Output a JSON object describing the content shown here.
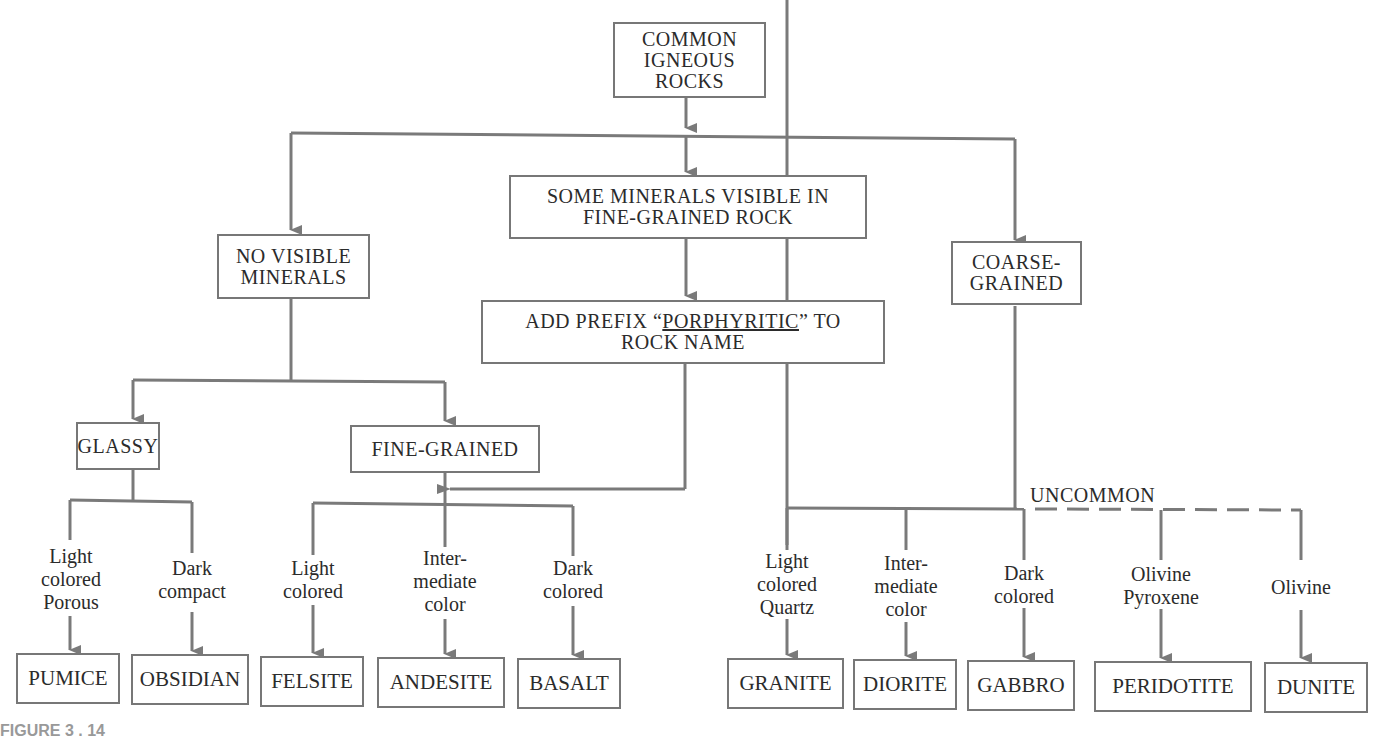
{
  "diagram": {
    "root": {
      "lines": [
        "COMMON",
        "IGNEOUS",
        "ROCKS"
      ]
    },
    "branches": {
      "no_visible": {
        "lines": [
          "NO VISIBLE",
          "MINERALS"
        ]
      },
      "some_visible": {
        "lines": [
          "SOME MINERALS VISIBLE IN",
          "FINE-GRAINED ROCK"
        ]
      },
      "porphyritic": {
        "line1_pre": "ADD PREFIX “",
        "line1_u": "PORPHYRITIC",
        "line1_post": "” TO",
        "line2": "ROCK NAME"
      },
      "coarse": {
        "lines": [
          "COARSE-",
          "GRAINED"
        ]
      }
    },
    "textures": {
      "glassy": "GLASSY",
      "fine_grained": "FINE-GRAINED"
    },
    "uncommon_label": "UNCOMMON",
    "criteria": [
      {
        "id": "pumice",
        "lines": [
          "Light",
          "colored",
          "Porous"
        ]
      },
      {
        "id": "obsidian",
        "lines": [
          "Dark",
          "compact"
        ]
      },
      {
        "id": "felsite",
        "lines": [
          "Light",
          "colored"
        ]
      },
      {
        "id": "andesite",
        "lines": [
          "Inter-",
          "mediate",
          "color"
        ]
      },
      {
        "id": "basalt",
        "lines": [
          "Dark",
          "colored"
        ]
      },
      {
        "id": "granite",
        "lines": [
          "Light",
          "colored",
          "Quartz"
        ]
      },
      {
        "id": "diorite",
        "lines": [
          "Inter-",
          "mediate",
          "color"
        ]
      },
      {
        "id": "gabbro",
        "lines": [
          "Dark",
          "colored"
        ]
      },
      {
        "id": "peridotite",
        "lines": [
          "Olivine",
          "Pyroxene"
        ]
      },
      {
        "id": "dunite",
        "lines": [
          "Olivine"
        ]
      }
    ],
    "rocks": [
      "PUMICE",
      "OBSIDIAN",
      "FELSITE",
      "ANDESITE",
      "BASALT",
      "GRANITE",
      "DIORITE",
      "GABBRO",
      "PERIDOTITE",
      "DUNITE"
    ],
    "caption_fragment": "FIGURE 3 . 14"
  },
  "colors": {
    "line": "#7a7a7a",
    "text": "#2b2b2b",
    "border": "#777777"
  }
}
